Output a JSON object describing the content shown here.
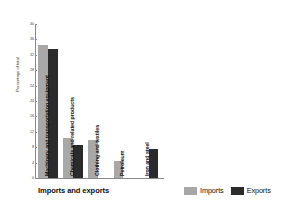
{
  "chart_data": {
    "type": "bar",
    "title": "",
    "xlabel": "Imports and exports",
    "ylabel": "Percentage of total",
    "categories": [
      "Machinery and transportation equipment",
      "Chemicals and related products",
      "Clothing and textiles",
      "Petroleum",
      "Iron and steel"
    ],
    "series": [
      {
        "name": "Imports",
        "color": "#a8a8a8",
        "values": [
          34.5,
          10.5,
          10.0,
          4.3,
          0
        ]
      },
      {
        "name": "Exports",
        "color": "#2b2b2b",
        "values": [
          33.5,
          8.5,
          0,
          0,
          7.5
        ]
      }
    ],
    "ylim": [
      0,
      40
    ],
    "yticks": [
      0,
      4,
      8,
      12,
      16,
      20,
      24,
      28,
      32,
      36,
      40
    ],
    "grid": false,
    "legend_position": "bottom-right"
  },
  "legend": {
    "imports_label": "Imports",
    "exports_label": "Exports"
  },
  "axis": {
    "x_title": "Imports and exports",
    "y_title": "Percentage of total"
  }
}
